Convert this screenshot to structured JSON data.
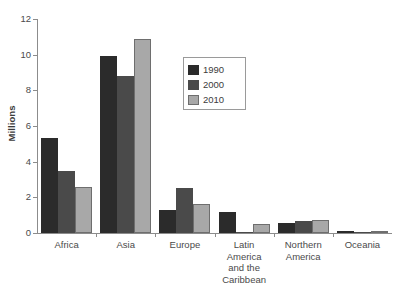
{
  "chart_data": {
    "type": "bar",
    "title": "",
    "xlabel": "",
    "ylabel": "Millions",
    "ylim": [
      0,
      12
    ],
    "yticks": [
      0,
      2,
      4,
      6,
      8,
      10,
      12
    ],
    "grid": false,
    "legend_position": "inside-upper-center",
    "categories": [
      "Africa",
      "Asia",
      "Europe",
      "Latin America and the Caribbean",
      "Northern America",
      "Oceania"
    ],
    "series": [
      {
        "name": "1990",
        "color": "#2b2b2b",
        "values": [
          5.3,
          9.9,
          1.3,
          1.2,
          0.55,
          0.13
        ]
      },
      {
        "name": "2000",
        "color": "#4a4a4a",
        "values": [
          3.5,
          8.8,
          2.5,
          0.05,
          0.65,
          0.03
        ]
      },
      {
        "name": "2010",
        "color": "#a8a8a8",
        "values": [
          2.6,
          10.9,
          1.6,
          0.5,
          0.75,
          0.0
        ]
      }
    ]
  },
  "axis": {
    "y_title": "Millions",
    "y_tick_labels": [
      "0",
      "2",
      "4",
      "6",
      "8",
      "10",
      "12"
    ]
  },
  "legend": {
    "entries": [
      {
        "label": "1990"
      },
      {
        "label": "2000"
      },
      {
        "label": "2010"
      }
    ]
  },
  "categories_display": [
    {
      "lines": [
        "Africa"
      ]
    },
    {
      "lines": [
        "Asia"
      ]
    },
    {
      "lines": [
        "Europe"
      ]
    },
    {
      "lines": [
        "Latin",
        "America",
        "and the",
        "Caribbean"
      ]
    },
    {
      "lines": [
        "Northern",
        "America"
      ]
    },
    {
      "lines": [
        "Oceania"
      ]
    }
  ]
}
